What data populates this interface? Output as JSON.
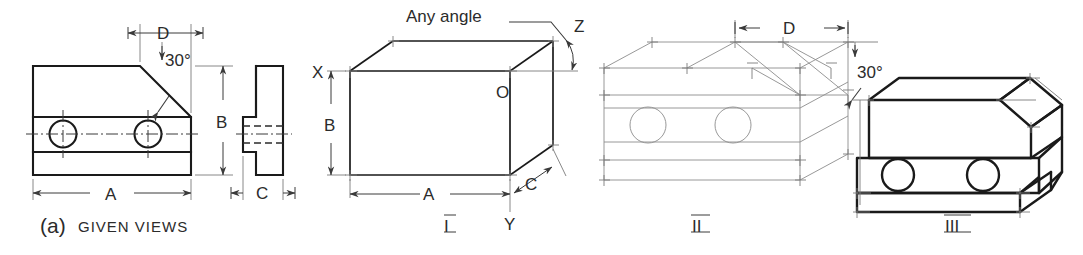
{
  "figure": {
    "title_label": "(a)",
    "title_text": "GIVEN VIEWS",
    "background_color": "#ffffff",
    "line_color": "#1a1a1a",
    "construction_color": "#8c8c8c"
  },
  "given_views": {
    "caption_prefix": "(a)",
    "caption": "GIVEN VIEWS",
    "dimensions": {
      "overall_length": "A",
      "overall_height": "B",
      "depth": "C",
      "chamfer_length": "D",
      "chamfer_angle": "30°"
    }
  },
  "step_one": {
    "numeral": "I",
    "corner_top_left": "X",
    "corner_origin": "O",
    "corner_bottom": "Y",
    "receding_axis": "Z",
    "note": "Any angle",
    "dimensions": {
      "length": "A",
      "height": "B",
      "depth": "C"
    }
  },
  "step_two": {
    "numeral": "II",
    "dimensions": {
      "chamfer_length": "D",
      "chamfer_angle": "30°"
    }
  },
  "step_three": {
    "numeral": "III"
  }
}
